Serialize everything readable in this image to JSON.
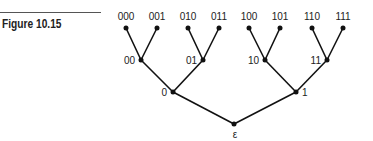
{
  "figure": {
    "caption": "Figure 10.15"
  },
  "tree": {
    "root": "ε",
    "level1": [
      "0",
      "1"
    ],
    "level2": [
      "00",
      "01",
      "10",
      "11"
    ],
    "leaves": [
      "000",
      "001",
      "010",
      "011",
      "100",
      "101",
      "110",
      "111"
    ]
  }
}
